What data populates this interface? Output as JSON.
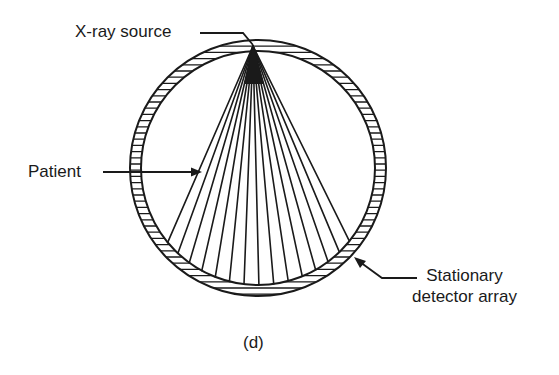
{
  "figure": {
    "caption": "(d)",
    "labels": {
      "xray_source": "X-ray source",
      "patient": "Patient",
      "detector_line1": "Stationary",
      "detector_line2": "detector array"
    }
  },
  "geometry": {
    "ring_center": [
      258,
      168
    ],
    "ring_outer_radius": 128,
    "ring_inner_radius": 117,
    "ring_hatch_count": 120,
    "source_apex": [
      253,
      46
    ],
    "fan_ray_count": 15,
    "fan_left_end": [
      167,
      243
    ],
    "fan_right_end": [
      348,
      240
    ]
  },
  "colors": {
    "ink": "#1a1a1a",
    "background": "#ffffff"
  }
}
